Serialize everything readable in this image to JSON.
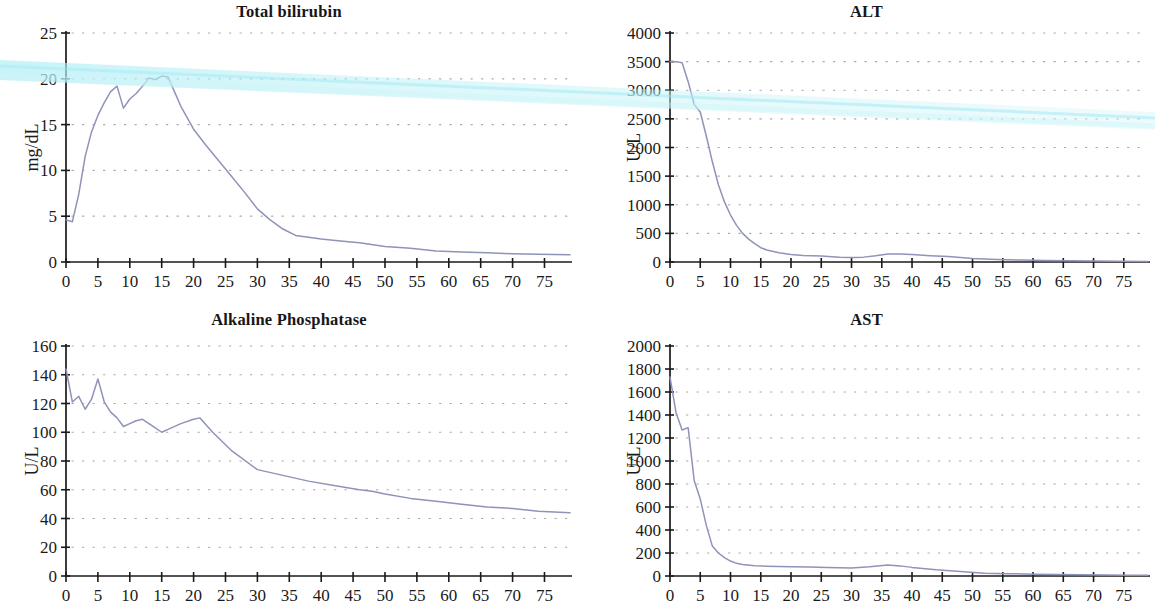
{
  "figure": {
    "background_color": "#ffffff",
    "line_color": "#8f93b8",
    "grid_dot_color": "#9a9a9a",
    "axis_color": "#1a1a1a",
    "scan_artifact_color": "#b8f0f5"
  },
  "panels": [
    {
      "id": "total-bilirubin",
      "position": "top-left"
    },
    {
      "id": "alt",
      "position": "top-right"
    },
    {
      "id": "alkaline-phosphatase",
      "position": "bottom-left"
    },
    {
      "id": "ast",
      "position": "bottom-right"
    }
  ],
  "chart_data": [
    {
      "type": "line",
      "title": "Total bilirubin",
      "xlabel": "",
      "ylabel": "mg/dL",
      "xlim": [
        0,
        79
      ],
      "ylim": [
        0,
        25
      ],
      "xticks": [
        0,
        5,
        10,
        15,
        20,
        25,
        30,
        35,
        40,
        45,
        50,
        55,
        60,
        65,
        70,
        75
      ],
      "yticks": [
        0,
        5,
        10,
        15,
        20,
        25
      ],
      "grid": true,
      "legend": "none",
      "x": [
        0,
        1,
        2,
        3,
        4,
        5,
        6,
        7,
        8,
        9,
        10,
        11,
        12,
        13,
        14,
        15,
        16,
        17,
        18,
        20,
        22,
        24,
        26,
        28,
        30,
        32,
        34,
        36,
        38,
        40,
        43,
        46,
        50,
        54,
        58,
        62,
        66,
        70,
        74,
        79
      ],
      "values": [
        4.6,
        4.4,
        7.4,
        11.5,
        14.2,
        16.0,
        17.4,
        18.6,
        19.2,
        16.8,
        17.8,
        18.4,
        19.2,
        20.1,
        19.9,
        20.3,
        20.2,
        18.6,
        17.0,
        14.5,
        12.7,
        11.0,
        9.3,
        7.6,
        5.8,
        4.6,
        3.6,
        2.9,
        2.7,
        2.5,
        2.3,
        2.1,
        1.7,
        1.5,
        1.2,
        1.1,
        1.0,
        0.9,
        0.85,
        0.8
      ]
    },
    {
      "type": "line",
      "title": "ALT",
      "xlabel": "",
      "ylabel": "U/L",
      "xlim": [
        0,
        79
      ],
      "ylim": [
        0,
        4000
      ],
      "xticks": [
        0,
        5,
        10,
        15,
        20,
        25,
        30,
        35,
        40,
        45,
        50,
        55,
        60,
        65,
        70,
        75
      ],
      "yticks": [
        0,
        500,
        1000,
        1500,
        2000,
        2500,
        3000,
        3500,
        4000
      ],
      "grid": true,
      "legend": "none",
      "x": [
        0,
        1,
        2,
        3,
        4,
        5,
        6,
        7,
        8,
        9,
        10,
        11,
        12,
        13,
        14,
        15,
        16,
        18,
        20,
        22,
        25,
        28,
        30,
        32,
        34,
        36,
        38,
        40,
        43,
        46,
        50,
        54,
        58,
        62,
        66,
        70,
        74,
        79
      ],
      "values": [
        3500,
        3500,
        3480,
        3150,
        2750,
        2620,
        2200,
        1750,
        1350,
        1050,
        820,
        640,
        500,
        400,
        320,
        250,
        210,
        160,
        130,
        115,
        105,
        85,
        80,
        85,
        110,
        140,
        140,
        130,
        110,
        95,
        60,
        45,
        35,
        28,
        22,
        18,
        14,
        10
      ]
    },
    {
      "type": "line",
      "title": "Alkaline Phosphatase",
      "xlabel": "",
      "ylabel": "U/L",
      "xlim": [
        0,
        79
      ],
      "ylim": [
        0,
        160
      ],
      "xticks": [
        0,
        5,
        10,
        15,
        20,
        25,
        30,
        35,
        40,
        45,
        50,
        55,
        60,
        65,
        70,
        75
      ],
      "yticks": [
        0,
        20,
        40,
        60,
        80,
        100,
        120,
        140,
        160
      ],
      "grid": true,
      "legend": "none",
      "x": [
        0,
        1,
        2,
        3,
        4,
        5,
        6,
        7,
        8,
        9,
        10,
        11,
        12,
        13,
        14,
        15,
        16,
        18,
        20,
        21,
        23,
        26,
        30,
        34,
        38,
        42,
        46,
        48,
        50,
        54,
        58,
        62,
        66,
        70,
        74,
        79
      ],
      "values": [
        144,
        121,
        125,
        116,
        123,
        137,
        121,
        114,
        110,
        104,
        106,
        108,
        109,
        106,
        103,
        100,
        102,
        106,
        109,
        110,
        100,
        87,
        74,
        70,
        66,
        63,
        60,
        59,
        57,
        54,
        52,
        50,
        48,
        47,
        45,
        44
      ]
    },
    {
      "type": "line",
      "title": "AST",
      "xlabel": "",
      "ylabel": "U/L",
      "xlim": [
        0,
        79
      ],
      "ylim": [
        0,
        2000
      ],
      "xticks": [
        0,
        5,
        10,
        15,
        20,
        25,
        30,
        35,
        40,
        45,
        50,
        55,
        60,
        65,
        70,
        75
      ],
      "yticks": [
        0,
        200,
        400,
        600,
        800,
        1000,
        1200,
        1400,
        1600,
        1800,
        2000
      ],
      "grid": true,
      "legend": "none",
      "x": [
        0,
        1,
        2,
        3,
        4,
        5,
        6,
        7,
        8,
        9,
        10,
        11,
        12,
        14,
        16,
        18,
        20,
        23,
        26,
        30,
        33,
        36,
        38,
        40,
        44,
        48,
        52,
        56,
        60,
        64,
        68,
        72,
        76,
        79
      ],
      "values": [
        1730,
        1420,
        1270,
        1290,
        830,
        670,
        440,
        260,
        200,
        160,
        130,
        110,
        100,
        90,
        85,
        82,
        80,
        78,
        75,
        70,
        80,
        95,
        88,
        75,
        55,
        40,
        25,
        20,
        16,
        12,
        10,
        8,
        7,
        6
      ]
    }
  ]
}
